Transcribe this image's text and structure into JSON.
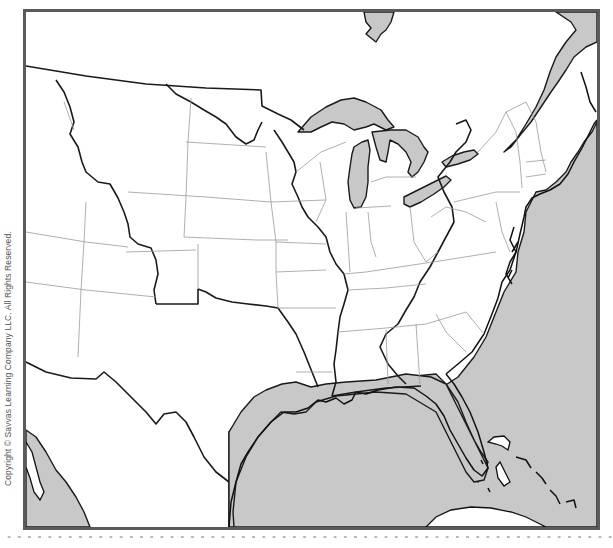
{
  "map": {
    "title": "",
    "type": "outline-map",
    "region": "Eastern and Central United States",
    "colors": {
      "water": "#c8c8c8",
      "land": "#ffffff",
      "frame": "#5a5a5a",
      "major_borders": "#1a1a1a",
      "state_lines": "#9a9a9a"
    },
    "features": {
      "great_lakes": [
        "Lake Superior",
        "Lake Michigan",
        "Lake Huron",
        "Lake Erie",
        "Lake Ontario"
      ],
      "water_bodies": [
        "Gulf of Mexico",
        "Atlantic Ocean",
        "Gulf of California",
        "Hudson Bay inlet",
        "Gulf of St. Lawrence"
      ],
      "islands": [
        "Cuba",
        "Bahamas"
      ]
    }
  },
  "copyright": "Copyright © Savvas Learning Company LLC. All Rights Reserved."
}
